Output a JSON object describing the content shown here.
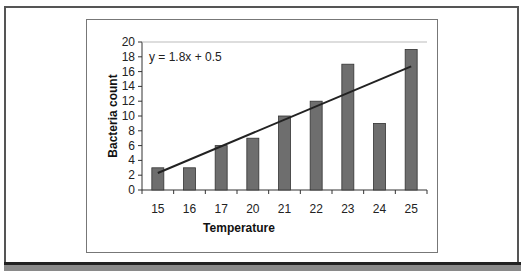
{
  "chart_data": {
    "type": "bar",
    "title": "",
    "xlabel": "Temperature",
    "ylabel": "Bacteria count",
    "categories": [
      "15",
      "16",
      "17",
      "20",
      "21",
      "22",
      "23",
      "24",
      "25"
    ],
    "values": [
      3,
      3,
      6,
      7,
      10,
      12,
      17,
      9,
      19
    ],
    "ylim": [
      0,
      20
    ],
    "yticks": [
      0,
      2,
      4,
      6,
      8,
      10,
      12,
      14,
      16,
      18,
      20
    ],
    "grid": false,
    "legend": null,
    "trendline": {
      "type": "linear",
      "equation": "y = 1.8x + 0.5",
      "slope": 1.8,
      "intercept": 0.5
    },
    "bar_color": "#6e6e6e"
  }
}
